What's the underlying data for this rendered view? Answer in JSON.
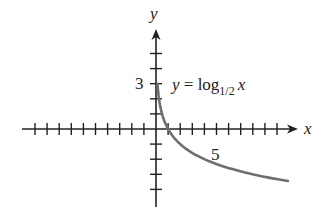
{
  "chart_data": {
    "type": "line",
    "title": "",
    "equation_label": {
      "lhs": "y",
      "eq": " = log",
      "base": "1/2",
      "arg": "x"
    },
    "xlabel": "x",
    "ylabel": "y",
    "x_tick_label": "5",
    "y_tick_label": "3",
    "xlim": [
      -10,
      11.5
    ],
    "ylim": [
      -5,
      6.5
    ],
    "x_ticks": [
      -10,
      -9,
      -8,
      -7,
      -6,
      -5,
      -4,
      -3,
      -2,
      -1,
      1,
      2,
      3,
      4,
      5,
      6,
      7,
      8,
      9,
      10
    ],
    "y_ticks": [
      -4,
      -3,
      -2,
      -1,
      1,
      2,
      3,
      4,
      5
    ],
    "series": [
      {
        "name": "y = log_{1/2} x",
        "function": "log_0.5(x)",
        "color": "#6e6e6e",
        "x": [
          0.125,
          0.25,
          0.5,
          1,
          2,
          4,
          8,
          10.9
        ],
        "y": [
          3,
          2,
          1,
          0,
          -1,
          -2,
          -3,
          -3.45
        ]
      }
    ],
    "grid": false,
    "legend": "none"
  },
  "layout": {
    "origin_px": [
      156,
      129
    ],
    "x_unit_px": 12.1,
    "y_unit_px": 15.1,
    "axis_color": "#222222",
    "curve_color": "#6e6e6e"
  }
}
